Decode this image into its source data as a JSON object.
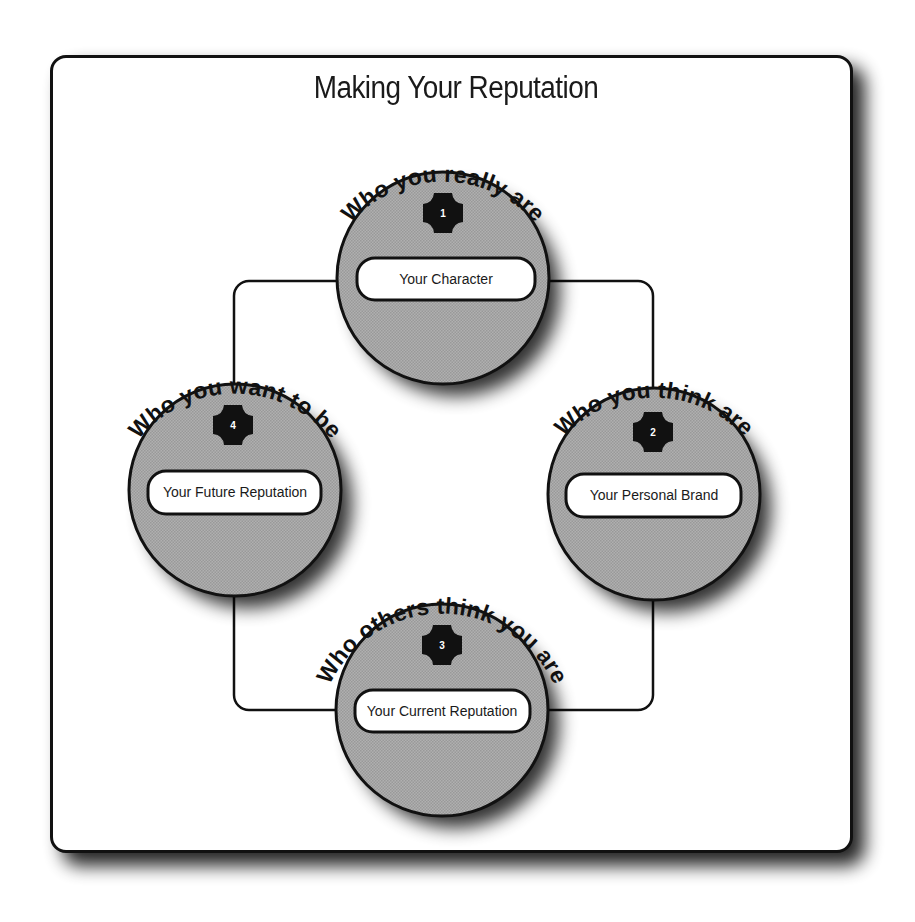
{
  "title": "Making Your Reputation",
  "colors": {
    "circle_fill": "#a9a9a9",
    "outline": "#111111",
    "pill_fill": "#ffffff",
    "badge_fill": "#111111",
    "card_bg": "#ffffff"
  },
  "nodes": [
    {
      "number": "1",
      "arc_label": "Who you really are",
      "pill_label": "Your Character",
      "position": "top"
    },
    {
      "number": "2",
      "arc_label": "Who you think are",
      "pill_label": "Your Personal Brand",
      "position": "right"
    },
    {
      "number": "3",
      "arc_label": "Who others think you are",
      "pill_label": "Your Current Reputation",
      "position": "bottom"
    },
    {
      "number": "4",
      "arc_label": "Who you want to be",
      "pill_label": "Your Future Reputation",
      "position": "left"
    }
  ],
  "connector": {
    "shape": "rounded-rectangle",
    "description": "loop connecting nodes 1 → 2 → 3 → 4 → 1"
  }
}
